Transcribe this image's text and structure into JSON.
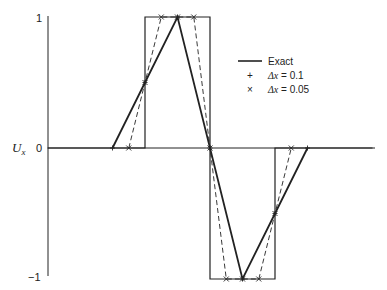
{
  "chart_data": {
    "type": "line",
    "title": "",
    "xlabel": "",
    "ylabel": "U_x",
    "ylim": [
      -1,
      1
    ],
    "xlim": [
      -0.5,
      0.5
    ],
    "grid": false,
    "legend_position": "upper right",
    "y_ticks": [
      "1",
      "0",
      "−1"
    ],
    "series": [
      {
        "name": "Exact",
        "style": "solid-thin",
        "x": [
          -0.5,
          -0.2,
          -0.2,
          0.0,
          0.0,
          0.2,
          0.2,
          0.5
        ],
        "values": [
          0,
          0,
          1,
          1,
          -1,
          -1,
          0,
          0
        ]
      },
      {
        "name": "Δx = 0.1",
        "marker": "+",
        "style": "solid-thick",
        "x": [
          -0.3,
          -0.2,
          -0.1,
          0.0,
          0.1,
          0.2,
          0.3
        ],
        "values": [
          0,
          0.5,
          1,
          0,
          -1,
          -0.5,
          0
        ]
      },
      {
        "name": "Δx = 0.05",
        "marker": "×",
        "style": "dashed",
        "x": [
          -0.25,
          -0.2,
          -0.15,
          -0.1,
          -0.05,
          0.0,
          0.05,
          0.1,
          0.15,
          0.2,
          0.25
        ],
        "values": [
          0,
          0.5,
          1,
          1,
          1,
          0,
          -1,
          -1,
          -1,
          -0.5,
          0
        ]
      }
    ]
  },
  "axis": {
    "y_label_main": "U",
    "y_label_sub": "x",
    "tick_1": "1",
    "tick_0": "0",
    "tick_neg1": "−1"
  },
  "legend": {
    "exact_label": "Exact",
    "dx01_marker": "+",
    "dx01_label_var": "Δx",
    "dx01_label_val": " = 0.1",
    "dx005_marker": "×",
    "dx005_label_var": "Δx",
    "dx005_label_val": " = 0.05"
  }
}
